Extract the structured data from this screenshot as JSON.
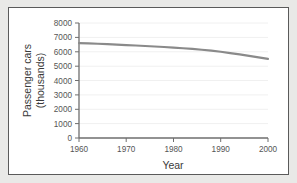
{
  "chart_data": {
    "type": "line",
    "title": "",
    "subtitle": "",
    "xlabel": "Year",
    "ylabel": "Passenger cars (thousands)",
    "ylabel_line1": "Passenger cars",
    "ylabel_line2": "(thousands)",
    "xlim": [
      1960,
      2000
    ],
    "ylim": [
      0,
      8000
    ],
    "xticks": [
      1960,
      1970,
      1980,
      1990,
      2000
    ],
    "xtick_labels": [
      "1960",
      "1970",
      "1980",
      "1990",
      "2000"
    ],
    "yticks": [
      0,
      1000,
      2000,
      3000,
      4000,
      5000,
      6000,
      7000,
      8000
    ],
    "ytick_labels": [
      "0",
      "1000",
      "2000",
      "3000",
      "4000",
      "5000",
      "6000",
      "7000",
      "8000"
    ],
    "grid": true,
    "grid_axis": "y",
    "legend": false,
    "legend_position": "none",
    "line_color": "#8a8a8a",
    "axis_color": "#6e6e6e",
    "grid_color": "#f0f0f0",
    "background_color": "#ffffff",
    "page_background_color": "#e9e9e7",
    "series": [
      {
        "name": "Passenger cars",
        "x": [
          1960,
          1962,
          1964,
          1966,
          1968,
          1970,
          1972,
          1974,
          1976,
          1978,
          1980,
          1982,
          1984,
          1986,
          1988,
          1990,
          1992,
          1994,
          1996,
          1998,
          2000
        ],
        "values": [
          6600,
          6580,
          6555,
          6525,
          6495,
          6465,
          6435,
          6400,
          6365,
          6330,
          6290,
          6245,
          6195,
          6140,
          6075,
          6000,
          5910,
          5815,
          5710,
          5605,
          5500
        ]
      }
    ]
  }
}
